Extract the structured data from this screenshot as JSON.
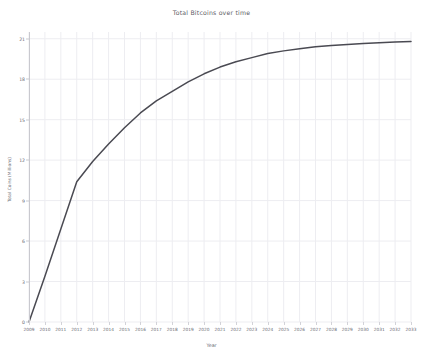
{
  "chart_data": {
    "type": "line",
    "title": "Total Bitcoins over time",
    "xlabel": "Year",
    "ylabel": "Total Coins (Millions)",
    "xlim": [
      2009,
      2033
    ],
    "ylim": [
      0,
      21.5
    ],
    "grid": true,
    "legend": false,
    "line_color": "#4a4a52",
    "grid_color": "#ededf1",
    "axis_color": "#c9c9cf",
    "background_color": "#ffffff",
    "yticks": [
      0,
      3,
      6,
      9,
      12,
      15,
      18,
      21
    ],
    "ytick_labels": [
      "0",
      "3",
      "6",
      "9",
      "12",
      "15",
      "18",
      "21"
    ],
    "x": [
      2009,
      2010,
      2011,
      2012,
      2013,
      2014,
      2015,
      2016,
      2017,
      2018,
      2019,
      2020,
      2021,
      2022,
      2023,
      2024,
      2025,
      2026,
      2027,
      2028,
      2029,
      2030,
      2031,
      2032,
      2033
    ],
    "xtick_labels": [
      "2009",
      "2010",
      "2011",
      "2012",
      "2013",
      "2014",
      "2015",
      "2016",
      "2017",
      "2018",
      "2019",
      "2020",
      "2021",
      "2022",
      "2023",
      "2024",
      "2025",
      "2026",
      "2027",
      "2028",
      "2029",
      "2030",
      "2031",
      "2032",
      "2033"
    ],
    "values": [
      0.0,
      3.4,
      6.9,
      10.4,
      11.9,
      13.2,
      14.4,
      15.5,
      16.4,
      17.1,
      17.8,
      18.4,
      18.9,
      19.3,
      19.6,
      19.9,
      20.1,
      20.25,
      20.4,
      20.5,
      20.58,
      20.65,
      20.71,
      20.76,
      20.8
    ],
    "series": [
      {
        "name": "Total Bitcoins",
        "values": [
          0.0,
          3.4,
          6.9,
          10.4,
          11.9,
          13.2,
          14.4,
          15.5,
          16.4,
          17.1,
          17.8,
          18.4,
          18.9,
          19.3,
          19.6,
          19.9,
          20.1,
          20.25,
          20.4,
          20.5,
          20.58,
          20.65,
          20.71,
          20.76,
          20.8
        ]
      }
    ]
  }
}
